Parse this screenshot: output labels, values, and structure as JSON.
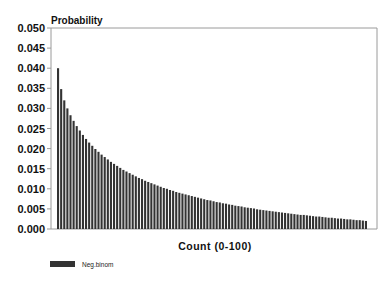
{
  "chart_data": {
    "type": "bar",
    "title": "",
    "xlabel": "Count (0-100)",
    "ylabel": "Probability",
    "ylim": [
      0,
      0.05
    ],
    "yticks": [
      "0.000",
      "0.005",
      "0.010",
      "0.015",
      "0.020",
      "0.025",
      "0.030",
      "0.035",
      "0.040",
      "0.045",
      "0.050"
    ],
    "grid": false,
    "legend_position": "bottom-left",
    "series": [
      {
        "name": "Neg.binom",
        "color": "#333333",
        "x_start": 0,
        "x_end": 99,
        "values": [
          0.04,
          0.0348,
          0.032,
          0.03,
          0.0283,
          0.0269,
          0.0256,
          0.0245,
          0.0234,
          0.0224,
          0.0215,
          0.0207,
          0.0199,
          0.0192,
          0.0185,
          0.0179,
          0.0173,
          0.0167,
          0.0162,
          0.0157,
          0.0152,
          0.0147,
          0.0143,
          0.0139,
          0.0135,
          0.0131,
          0.0127,
          0.0124,
          0.012,
          0.0117,
          0.0114,
          0.0111,
          0.0108,
          0.0105,
          0.0102,
          0.01,
          0.0097,
          0.0095,
          0.0092,
          0.009,
          0.0088,
          0.0086,
          0.0084,
          0.0082,
          0.008,
          0.0078,
          0.0076,
          0.0074,
          0.0072,
          0.0071,
          0.0069,
          0.0067,
          0.0066,
          0.0064,
          0.0063,
          0.0061,
          0.006,
          0.0058,
          0.0057,
          0.0056,
          0.0054,
          0.0053,
          0.0052,
          0.0051,
          0.0049,
          0.0048,
          0.0047,
          0.0046,
          0.0045,
          0.0044,
          0.0043,
          0.0042,
          0.0041,
          0.004,
          0.0039,
          0.0038,
          0.0037,
          0.0036,
          0.0035,
          0.0035,
          0.0034,
          0.0033,
          0.0032,
          0.0031,
          0.0031,
          0.003,
          0.0029,
          0.0028,
          0.0028,
          0.0027,
          0.0026,
          0.0026,
          0.0025,
          0.0024,
          0.0024,
          0.0023,
          0.0022,
          0.0022,
          0.0021,
          0.002
        ]
      }
    ]
  },
  "legend": {
    "label": "Neg.binom"
  }
}
